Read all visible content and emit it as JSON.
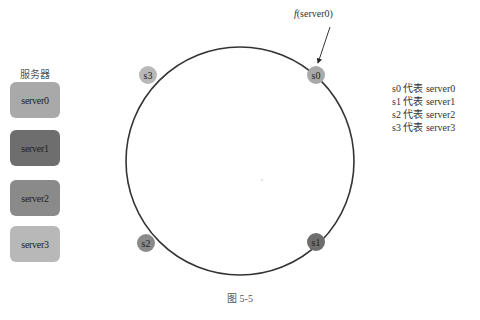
{
  "sidebar": {
    "title": "服务器",
    "servers": [
      {
        "label": "server0",
        "color": "#a9a9a9"
      },
      {
        "label": "server1",
        "color": "#6e6e6e"
      },
      {
        "label": "server2",
        "color": "#8a8a8a"
      },
      {
        "label": "server3",
        "color": "#b8b8b8"
      }
    ]
  },
  "ring": {
    "center": [
      240,
      161
    ],
    "radius": 114,
    "stroke_color": "#333333",
    "nodes": [
      {
        "label": "s0",
        "x": 316,
        "y": 75,
        "color": "#a9a9a9"
      },
      {
        "label": "s1",
        "x": 316,
        "y": 242,
        "color": "#6e6e6e"
      },
      {
        "label": "s2",
        "x": 146,
        "y": 243,
        "color": "#8a8a8a"
      },
      {
        "label": "s3",
        "x": 148,
        "y": 75,
        "color": "#b8b8b8"
      }
    ]
  },
  "annotation": {
    "func": "f",
    "arg": "(server0)"
  },
  "legend": {
    "items": [
      "s0 代表 server0",
      "s1 代表 server1",
      "s2 代表 server2",
      "s3 代表 server3"
    ]
  },
  "caption": "图 5-5"
}
